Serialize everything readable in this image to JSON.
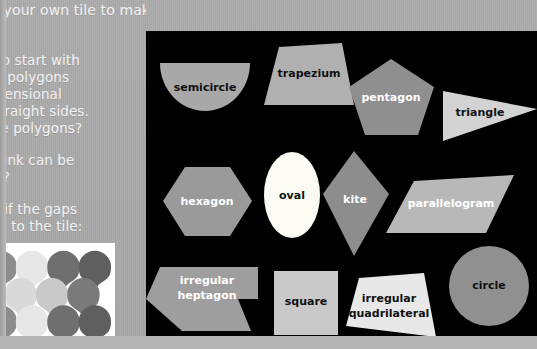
{
  "page": {
    "background_color": "#a9a9a9",
    "text_color": "#f2f2f2"
  },
  "left_column": {
    "intro_line": "design your own tile to make your own pattern.",
    "heading": "te?",
    "body_lines": [
      "ation is to start with",
      "not all polygons",
      "wo-dimensional",
      "more straight sides.",
      "right are polygons?",
      "you think can be",
      "gaps?",
      "ellations if the gaps",
      "added to the tile:"
    ],
    "tessellation_image": {
      "name": "tessellation-sample",
      "background": "#ffffff",
      "tile_colors": [
        "#8c8c8c",
        "#e6e6e6",
        "#6f6f6f",
        "#5f5f5f",
        "#a0a0a0",
        "#d9d9d9",
        "#c9c9c9",
        "#7a7a7a"
      ]
    }
  },
  "shapes_panel": {
    "background_color": "#000000",
    "shapes": [
      {
        "label": "semicircle",
        "fill": "#a8a8a8",
        "text": "dark"
      },
      {
        "label": "trapezium",
        "fill": "#b0b0b0",
        "text": "dark"
      },
      {
        "label": "pentagon",
        "fill": "#8f8f8f",
        "text": "light"
      },
      {
        "label": "triangle",
        "fill": "#d3d3d3",
        "text": "dark"
      },
      {
        "label": "hexagon",
        "fill": "#9a9a9a",
        "text": "light"
      },
      {
        "label": "oval",
        "fill": "#fbfbf4",
        "text": "dark"
      },
      {
        "label": "kite",
        "fill": "#8d8d8d",
        "text": "light"
      },
      {
        "label": "parallelogram",
        "fill": "#b8b8b8",
        "text": "light"
      },
      {
        "label": "irregular heptagon",
        "fill": "#9e9e9e",
        "text": "light"
      },
      {
        "label": "square",
        "fill": "#c9c9c9",
        "text": "dark"
      },
      {
        "label": "irregular quadrilateral",
        "fill": "#e8e8e8",
        "text": "dark"
      },
      {
        "label": "circle",
        "fill": "#909090",
        "text": "dark"
      }
    ],
    "irregular_heptagon_label_lines": [
      "irregular",
      "heptagon"
    ],
    "irregular_quadrilateral_label_lines": [
      "irregular",
      "quadrilateral"
    ]
  }
}
